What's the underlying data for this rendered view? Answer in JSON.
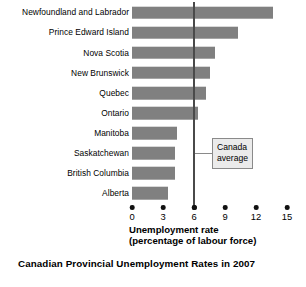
{
  "caption": "Canadian Provincial Unemployment Rates in 2007",
  "annotation": {
    "line1": "Canada",
    "line2": "average",
    "value": 6.0
  },
  "axis": {
    "title_line1": "Unemployment rate",
    "title_line2": "(percentage of labour force)"
  },
  "colors": {
    "bar": "#808080",
    "average_line": "#4a4a4a",
    "annotation_fill": "#ebebeb",
    "annotation_border": "#8a8a8a",
    "text": "#000000",
    "background": "#ffffff"
  },
  "chart_data": {
    "type": "bar",
    "orientation": "horizontal",
    "title": "Canadian Provincial Unemployment Rates in 2007",
    "xlabel": "Unemployment rate (percentage of labour force)",
    "ylabel": "",
    "xlim": [
      0,
      15
    ],
    "xticks": [
      0,
      3,
      6,
      9,
      12,
      15
    ],
    "xtick_labels": [
      "0",
      "3",
      "6",
      "9",
      "12",
      "15"
    ],
    "grid": false,
    "legend": "none",
    "categories": [
      "Newfoundland and Labrador",
      "Prince Edward Island",
      "Nova Scotia",
      "New Brunswick",
      "Quebec",
      "Ontario",
      "Manitoba",
      "Saskatchewan",
      "British Columbia",
      "Alberta"
    ],
    "values": [
      13.6,
      10.3,
      8.0,
      7.5,
      7.2,
      6.4,
      4.4,
      4.2,
      4.2,
      3.5
    ],
    "annotations": [
      {
        "label": "Canada average",
        "type": "vertical-reference-line",
        "x": 6.0
      }
    ]
  }
}
